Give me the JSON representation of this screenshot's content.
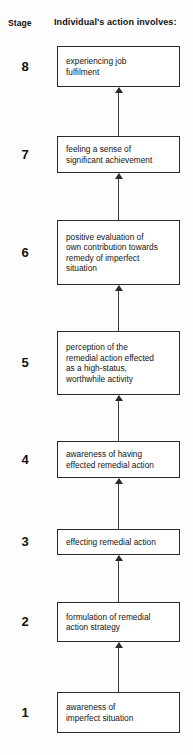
{
  "header": {
    "stage_label": "Stage",
    "column_label": "Individual's action involves:"
  },
  "diagram": {
    "type": "flowchart",
    "direction": "bottom-to-top",
    "arrow_icon": "arrow-up-icon",
    "box_border_color": "#2b2b2b",
    "background_color": "#fdfdfd",
    "stages": [
      {
        "number": "8",
        "text": "experiencing job\nfulfilment",
        "box": {
          "top": 46,
          "height": 41
        },
        "arrow": {
          "top": 87,
          "height": 49
        }
      },
      {
        "number": "7",
        "text": "feeling a sense of\nsignificant achievement",
        "box": {
          "top": 136,
          "height": 37
        },
        "arrow": {
          "top": 173,
          "height": 47
        }
      },
      {
        "number": "6",
        "text": "positive evaluation of\nown contribution towards\nremedy of imperfect\nsituation",
        "box": {
          "top": 220,
          "height": 65
        },
        "arrow": {
          "top": 285,
          "height": 46
        }
      },
      {
        "number": "5",
        "text": "perception of the\nremedial action effected\nas a high-status,\nworthwhile activity",
        "box": {
          "top": 331,
          "height": 64
        },
        "arrow": {
          "top": 395,
          "height": 46
        }
      },
      {
        "number": "4",
        "text": "awareness of having\neffected remedial action",
        "box": {
          "top": 441,
          "height": 37
        },
        "arrow": {
          "top": 478,
          "height": 51
        }
      },
      {
        "number": "3",
        "text": "effecting remedial action",
        "box": {
          "top": 529,
          "height": 26
        },
        "arrow": {
          "top": 555,
          "height": 47
        }
      },
      {
        "number": "2",
        "text": "formulation of remedial\naction strategy",
        "box": {
          "top": 602,
          "height": 40
        },
        "arrow": {
          "top": 642,
          "height": 50
        }
      },
      {
        "number": "1",
        "text": "awareness of\nimperfect situation",
        "box": {
          "top": 692,
          "height": 41
        },
        "arrow": null
      }
    ]
  }
}
